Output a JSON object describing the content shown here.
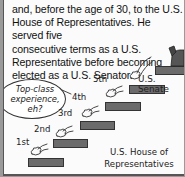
{
  "paragraph": {
    "lines": [
      "and, before the age of 30, to the U.S.",
      "House of Representatives. He served five",
      "consecutive terms as a U.S.",
      "Representative before becoming",
      "elected as a U.S. Senator."
    ]
  },
  "cartoon": {
    "speech_bubble": {
      "lines": [
        "Top-class",
        "experience,",
        "eh?"
      ]
    },
    "steps": [
      {
        "label": "1st"
      },
      {
        "label": "2nd"
      },
      {
        "label": "3rd"
      },
      {
        "label": "4th"
      },
      {
        "label": "5th"
      }
    ],
    "senate_label": "U.S. Senate",
    "house_label": {
      "line1": "U.S. House of",
      "line2": "Representatives"
    },
    "colors": {
      "bar": "#6b6b6b",
      "border": "#9a9a9a"
    }
  }
}
